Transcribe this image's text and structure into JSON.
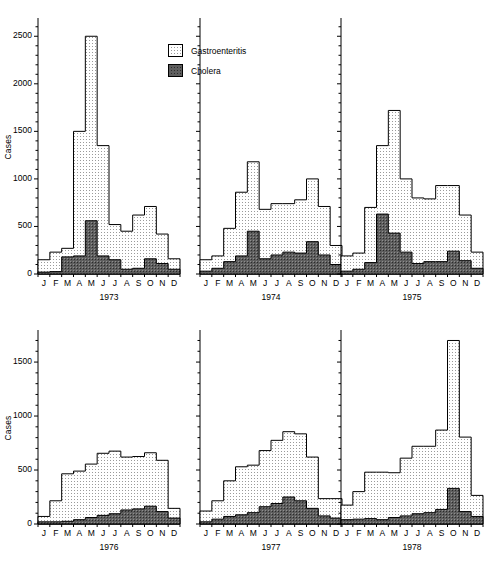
{
  "figure": {
    "ylabel": "Cases",
    "months": [
      "J",
      "F",
      "M",
      "A",
      "M",
      "J",
      "J",
      "A",
      "S",
      "O",
      "N",
      "D"
    ]
  },
  "legend": {
    "position": "top-center",
    "items": [
      {
        "label": "Gastroenteritis",
        "swatch": "light-dotted-swatch",
        "color": "#f2f2f2"
      },
      {
        "label": "Cholera",
        "swatch": "dark-dotted-swatch",
        "color": "#595959"
      }
    ]
  },
  "chart_data": {
    "type": "bar",
    "title": "",
    "xlabel": "",
    "ylabel": "Cases",
    "grid": false,
    "legend_position": "top-center",
    "categories": [
      "J",
      "F",
      "M",
      "A",
      "M",
      "J",
      "J",
      "A",
      "S",
      "O",
      "N",
      "D"
    ],
    "panels": [
      {
        "year": "1973",
        "row": 0,
        "ylim": [
          0,
          2650
        ],
        "yticks": [
          0,
          500,
          1000,
          1500,
          2000,
          2500
        ],
        "series": [
          {
            "name": "Gastroenteritis",
            "values": [
              150,
              140,
              230,
              270,
              1500,
              2500,
              1350,
              520,
              450,
              620,
              650,
              710,
              420,
              160
            ]
          },
          {
            "name": "Cholera",
            "values": [
              20,
              20,
              25,
              180,
              190,
              560,
              190,
              150,
              50,
              60,
              80,
              160,
              110,
              50
            ]
          }
        ],
        "total_values": [
          150,
          230,
          270,
          1500,
          2500,
          1350,
          520,
          450,
          620,
          710,
          420,
          160
        ],
        "cholera_values": [
          20,
          25,
          180,
          190,
          560,
          190,
          150,
          50,
          60,
          160,
          110,
          50
        ]
      },
      {
        "year": "1974",
        "row": 0,
        "ylim": [
          0,
          2650
        ],
        "yticks": [
          0,
          500,
          1000,
          1500,
          2000,
          2500
        ],
        "total_values": [
          150,
          190,
          480,
          860,
          1180,
          680,
          740,
          740,
          780,
          1000,
          710,
          300
        ],
        "cholera_values": [
          30,
          60,
          130,
          190,
          450,
          160,
          200,
          230,
          220,
          340,
          200,
          100
        ]
      },
      {
        "year": "1975",
        "row": 0,
        "ylim": [
          0,
          2650
        ],
        "yticks": [
          0,
          500,
          1000,
          1500,
          2000,
          2500
        ],
        "total_values": [
          190,
          220,
          700,
          1350,
          1720,
          1000,
          800,
          790,
          930,
          930,
          620,
          230
        ],
        "cholera_values": [
          30,
          50,
          120,
          630,
          430,
          230,
          110,
          130,
          130,
          240,
          140,
          60
        ]
      },
      {
        "year": "1976",
        "row": 1,
        "ylim": [
          0,
          1760
        ],
        "yticks": [
          0,
          500,
          1000,
          1500
        ],
        "total_values": [
          70,
          215,
          465,
          490,
          555,
          655,
          675,
          620,
          625,
          660,
          590,
          145
        ],
        "cholera_values": [
          20,
          20,
          25,
          40,
          60,
          80,
          95,
          130,
          140,
          165,
          115,
          55
        ]
      },
      {
        "year": "1977",
        "row": 1,
        "ylim": [
          0,
          1760
        ],
        "yticks": [
          0,
          500,
          1000,
          1500
        ],
        "total_values": [
          120,
          215,
          400,
          530,
          545,
          680,
          775,
          855,
          835,
          620,
          235,
          235
        ],
        "cholera_values": [
          20,
          45,
          70,
          85,
          105,
          160,
          190,
          250,
          215,
          145,
          75,
          55
        ]
      },
      {
        "year": "1978",
        "row": 1,
        "ylim": [
          0,
          1760
        ],
        "yticks": [
          0,
          500,
          1000,
          1500
        ],
        "total_values": [
          175,
          300,
          480,
          480,
          475,
          610,
          720,
          720,
          870,
          1700,
          805,
          265
        ],
        "cholera_values": [
          40,
          45,
          50,
          40,
          60,
          75,
          95,
          105,
          135,
          330,
          115,
          70
        ]
      }
    ]
  }
}
